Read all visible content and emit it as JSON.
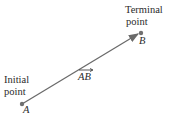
{
  "diagram": {
    "initial_label_line1": "Initial",
    "initial_label_line2": "point",
    "terminal_label_line1": "Terminal",
    "terminal_label_line2": "point",
    "point_a": "A",
    "point_b": "B",
    "vector_label": "AB",
    "colors": {
      "vector": "#6a6a6a",
      "text": "#2b2b2b",
      "point": "#707070"
    }
  }
}
